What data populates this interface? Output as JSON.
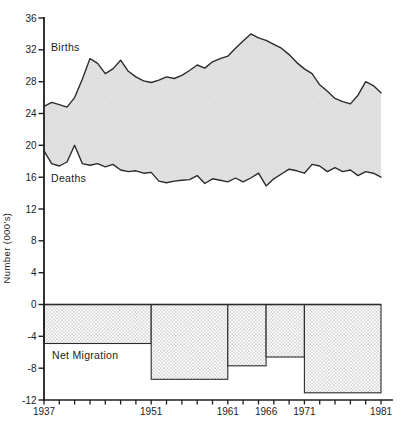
{
  "figure": {
    "background": "#ffffff"
  },
  "chart_data": {
    "type": "area",
    "title": "",
    "xlabel": "",
    "ylabel": "Number (000's)",
    "ylim": [
      -12,
      36
    ],
    "y_tick_step": 4,
    "y_tick_values": [
      36,
      32,
      28,
      24,
      20,
      16,
      12,
      8,
      4,
      0,
      -4,
      -8,
      -12
    ],
    "x_range": [
      1937,
      1981
    ],
    "x_minor_tick_step_years": 2,
    "x_tick_labels": [
      "1937",
      "1951",
      "1961",
      "1966",
      "1971",
      "1981"
    ],
    "x_tick_label_years": [
      1937,
      1951,
      1961,
      1966,
      1971,
      1981
    ],
    "grid": false,
    "legend_position": "labels-inside-plot",
    "years": [
      1937,
      1938,
      1939,
      1940,
      1941,
      1942,
      1943,
      1944,
      1945,
      1946,
      1947,
      1948,
      1949,
      1950,
      1951,
      1952,
      1953,
      1954,
      1955,
      1956,
      1957,
      1958,
      1959,
      1960,
      1961,
      1962,
      1963,
      1964,
      1965,
      1966,
      1967,
      1968,
      1969,
      1970,
      1971,
      1972,
      1973,
      1974,
      1975,
      1976,
      1977,
      1978,
      1979,
      1980,
      1981
    ],
    "series": [
      {
        "name": "Births",
        "values": [
          24.9,
          25.4,
          25.1,
          24.8,
          26.0,
          28.3,
          30.9,
          30.3,
          29.0,
          29.6,
          30.7,
          29.3,
          28.6,
          28.1,
          27.9,
          28.2,
          28.6,
          28.4,
          28.8,
          29.4,
          30.1,
          29.7,
          30.5,
          30.9,
          31.2,
          32.2,
          33.1,
          34.0,
          33.5,
          33.2,
          32.7,
          32.2,
          31.4,
          30.4,
          29.6,
          29.0,
          27.6,
          26.8,
          25.9,
          25.5,
          25.2,
          26.3,
          28.0,
          27.5,
          26.6
        ]
      },
      {
        "name": "Deaths",
        "values": [
          19.3,
          17.7,
          17.4,
          17.9,
          20.0,
          17.7,
          17.5,
          17.7,
          17.3,
          17.6,
          16.9,
          16.7,
          16.8,
          16.5,
          16.6,
          15.5,
          15.3,
          15.5,
          15.6,
          15.7,
          16.2,
          15.2,
          15.8,
          15.6,
          15.4,
          15.9,
          15.4,
          15.9,
          16.5,
          14.9,
          15.8,
          16.4,
          17.0,
          16.8,
          16.5,
          17.6,
          17.4,
          16.7,
          17.2,
          16.7,
          16.9,
          16.2,
          16.7,
          16.5,
          16.0
        ]
      }
    ],
    "net_migration_label": "Net Migration",
    "net_migration_bars": [
      {
        "from": 1937,
        "to": 1951,
        "value": -4.9
      },
      {
        "from": 1951,
        "to": 1961,
        "value": -9.4
      },
      {
        "from": 1961,
        "to": 1966,
        "value": -7.7
      },
      {
        "from": 1966,
        "to": 1971,
        "value": -6.6
      },
      {
        "from": 1971,
        "to": 1981,
        "value": -11.1
      }
    ],
    "colors": {
      "line": "#2b2b2b",
      "axis": "#1e1e1e",
      "band_fill_base": "#ececec",
      "band_fill_dot": "#c8c8c8",
      "bar_fill_base": "#ffffff",
      "bar_fill_dot": "#8c8c8c",
      "background": "#ffffff"
    }
  }
}
